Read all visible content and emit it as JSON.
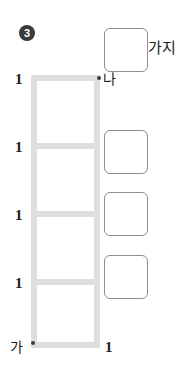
{
  "problem": {
    "number_badge": "3"
  },
  "figure": {
    "name": "ladder-grid",
    "vertices": [
      {
        "id": "na",
        "label": "나",
        "position": "top-right"
      },
      {
        "id": "ga",
        "label": "가",
        "position": "bottom-left"
      }
    ],
    "edge_labels": {
      "left_segments": [
        "1",
        "1",
        "1",
        "1"
      ],
      "bottom": "1"
    },
    "cell_count": 4,
    "rung_count": 5,
    "colors": {
      "ladder_stroke": "#dedede",
      "vertex_dot": "#3a3a3a",
      "text": "#1b1b1b",
      "badge_fill": "#3b3b3b",
      "answer_box_border": "#8d8d8d"
    }
  },
  "answers": {
    "unit_caption": "가지",
    "boxes": [
      {
        "id": "box-1",
        "value": ""
      },
      {
        "id": "box-2",
        "value": ""
      },
      {
        "id": "box-3",
        "value": ""
      },
      {
        "id": "box-4",
        "value": ""
      }
    ]
  }
}
